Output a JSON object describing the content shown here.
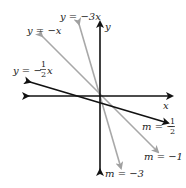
{
  "diagram": {
    "axes": {
      "x_label": "x",
      "y_label": "y"
    },
    "lines": [
      {
        "equation": "y = -3x",
        "slope_label": "m = -3",
        "slope": -3,
        "color": "#a0a0a0"
      },
      {
        "equation": "y = -x",
        "slope_label": "m = -1",
        "slope": -1,
        "color": "#a0a0a0"
      },
      {
        "equation": "y = -½x",
        "slope_label": "m = -½",
        "slope": -0.5,
        "color": "#111111"
      }
    ],
    "labels": {
      "eq_neg3": "y = −3x",
      "eq_neg1": "y = −x",
      "eq_neghalf_prefix": "y = −",
      "eq_neghalf_num": "1",
      "eq_neghalf_den": "2",
      "eq_neghalf_suffix": "x",
      "m_neghalf_prefix": "m = −",
      "m_neghalf_num": "1",
      "m_neghalf_den": "2",
      "m_neg1": "m = −1",
      "m_neg3": "m = −3"
    }
  }
}
